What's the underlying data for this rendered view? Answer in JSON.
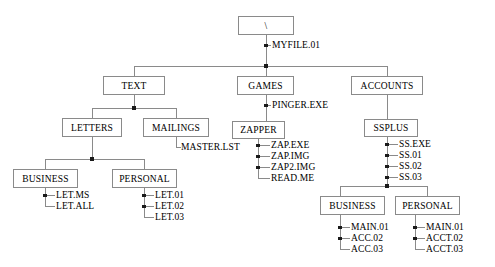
{
  "diagram": {
    "line_color": "#8a8a8a",
    "text_color": "#000000",
    "background": "#ffffff"
  },
  "nodes": {
    "root": {
      "label": "\\",
      "x": 238,
      "y": 16,
      "w": 56,
      "h": 19
    },
    "text": {
      "label": "TEXT",
      "x": 103,
      "y": 76,
      "w": 62,
      "h": 19
    },
    "games": {
      "label": "GAMES",
      "x": 237,
      "y": 76,
      "w": 57,
      "h": 19
    },
    "accounts": {
      "label": "ACCOUNTS",
      "x": 351,
      "y": 76,
      "w": 72,
      "h": 19
    },
    "letters": {
      "label": "LETTERS",
      "x": 62,
      "y": 118,
      "w": 60,
      "h": 19
    },
    "mailings": {
      "label": "MAILINGS",
      "x": 143,
      "y": 118,
      "w": 66,
      "h": 19
    },
    "zapper": {
      "label": "ZAPPER",
      "x": 232,
      "y": 121,
      "w": 53,
      "h": 18
    },
    "ssplus": {
      "label": "SSPLUS",
      "x": 364,
      "y": 119,
      "w": 54,
      "h": 18
    },
    "letters_business": {
      "label": "BUSINESS",
      "x": 13,
      "y": 169,
      "w": 65,
      "h": 19
    },
    "letters_personal": {
      "label": "PERSONAL",
      "x": 112,
      "y": 169,
      "w": 65,
      "h": 19
    },
    "ssplus_business": {
      "label": "BUSINESS",
      "x": 320,
      "y": 196,
      "w": 65,
      "h": 19
    },
    "ssplus_personal": {
      "label": "PERSONAL",
      "x": 395,
      "y": 196,
      "w": 65,
      "h": 19
    }
  },
  "files": {
    "root_child": [
      {
        "label": "MYFILE.01",
        "x": 272,
        "y": 45
      }
    ],
    "games_files": [
      {
        "label": "PINGER.EXE",
        "x": 272,
        "y": 105
      }
    ],
    "mailings_files": [
      {
        "label": "MASTER.LST",
        "x": 181,
        "y": 147
      }
    ],
    "zapper_files": [
      {
        "label": "ZAP.EXE",
        "x": 271,
        "y": 145
      },
      {
        "label": "ZAP.IMG",
        "x": 271,
        "y": 156
      },
      {
        "label": "ZAP2.IMG",
        "x": 271,
        "y": 167
      },
      {
        "label": "READ.ME",
        "x": 271,
        "y": 178
      }
    ],
    "ssplus_files": [
      {
        "label": "SS.EXE",
        "x": 399,
        "y": 144
      },
      {
        "label": "SS.01",
        "x": 399,
        "y": 155
      },
      {
        "label": "SS.02",
        "x": 399,
        "y": 166
      },
      {
        "label": "SS.03",
        "x": 399,
        "y": 177
      }
    ],
    "letters_business_files": [
      {
        "label": "LET.MS",
        "x": 56,
        "y": 195
      },
      {
        "label": "LET.ALL",
        "x": 56,
        "y": 206
      }
    ],
    "letters_personal_files": [
      {
        "label": "LET.01",
        "x": 155,
        "y": 195
      },
      {
        "label": "LET.02",
        "x": 155,
        "y": 206
      },
      {
        "label": "LET.03",
        "x": 155,
        "y": 217
      }
    ],
    "ssplus_business_files": [
      {
        "label": "MAIN.01",
        "x": 351,
        "y": 227
      },
      {
        "label": "ACC.02",
        "x": 351,
        "y": 238
      },
      {
        "label": "ACC.03",
        "x": 351,
        "y": 249
      }
    ],
    "ssplus_personal_files": [
      {
        "label": "MAIN.01",
        "x": 426,
        "y": 227
      },
      {
        "label": "ACCT.02",
        "x": 426,
        "y": 238
      },
      {
        "label": "ACCT.03",
        "x": 426,
        "y": 249
      }
    ]
  }
}
